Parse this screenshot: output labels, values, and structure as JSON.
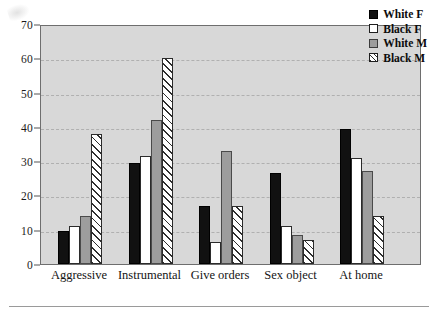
{
  "chart_data": {
    "type": "bar",
    "title": "",
    "subtitle": "",
    "xlabel": "",
    "ylabel": "",
    "categories": [
      "Aggressive",
      "Instrumental",
      "Give orders",
      "Sex object",
      "At home"
    ],
    "series": [
      {
        "name": "White F",
        "fill": "solid-black",
        "color": "#111111",
        "values": [
          9.5,
          29.5,
          17,
          26.5,
          39.5
        ]
      },
      {
        "name": "Black F",
        "fill": "solid-white",
        "color": "#ffffff",
        "values": [
          11,
          31.5,
          6.5,
          11,
          31
        ]
      },
      {
        "name": "White M",
        "fill": "solid-gray",
        "color": "#9d9d9d",
        "values": [
          14,
          42,
          33,
          8.5,
          27
        ]
      },
      {
        "name": "Black M",
        "fill": "diagonal-hatch",
        "color": "#ffffff",
        "values": [
          38,
          60,
          17,
          7,
          14
        ]
      }
    ],
    "ylim": [
      0,
      70
    ],
    "yticks": [
      0,
      10,
      20,
      30,
      40,
      50,
      60,
      70
    ],
    "ytick_labels": [
      "0",
      "10",
      "20",
      "30",
      "40",
      "50",
      "60",
      "70"
    ],
    "grid": true,
    "grid_style": "dashed-horizontal",
    "legend_position": "top-right",
    "plot_background": "#d8d8d8",
    "frame_color": "#6e6e6e"
  },
  "legend": {
    "entries": [
      {
        "label": "White F"
      },
      {
        "label": "Black F"
      },
      {
        "label": "White M"
      },
      {
        "label": "Black M"
      }
    ]
  }
}
